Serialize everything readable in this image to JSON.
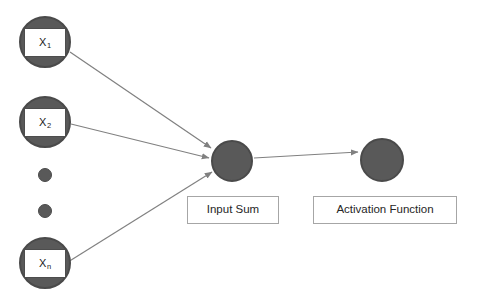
{
  "diagram": {
    "background_color": "#ffffff",
    "node_fill_color": "#595959",
    "node_border_color": "#4a4a4a",
    "arrow_color": "#808080",
    "caption_border_color": "#a6a6a6",
    "label_border_color": "#4d4d4d",
    "text_color": "#262626"
  },
  "inputs": [
    {
      "id": "x1",
      "label_base": "X",
      "label_sub": "1",
      "cx": 45,
      "cy": 42,
      "r": 26
    },
    {
      "id": "x2",
      "label_base": "X",
      "label_sub": "2",
      "cx": 45,
      "cy": 122,
      "r": 26
    },
    {
      "id": "xn",
      "label_base": "X",
      "label_sub": "n",
      "cx": 45,
      "cy": 263,
      "r": 26
    }
  ],
  "ellipsis": [
    {
      "id": "dot-1",
      "cx": 45,
      "cy": 175,
      "r": 7
    },
    {
      "id": "dot-2",
      "cx": 45,
      "cy": 211,
      "r": 7
    }
  ],
  "nodes": {
    "sum": {
      "id": "input-sum",
      "cx": 232,
      "cy": 161,
      "r": 21,
      "caption": "Input Sum",
      "caption_x": 187,
      "caption_y": 196,
      "caption_w": 92,
      "caption_h": 28
    },
    "activation": {
      "id": "activation-function",
      "cx": 382,
      "cy": 160,
      "r": 22,
      "caption": "Activation Function",
      "caption_x": 313,
      "caption_y": 196,
      "caption_w": 144,
      "caption_h": 28
    }
  },
  "edges": [
    {
      "id": "edge-x1-sum",
      "from": "x1",
      "to": "input-sum",
      "x1": 70,
      "y1": 52,
      "x2": 211,
      "y2": 148
    },
    {
      "id": "edge-x2-sum",
      "from": "x2",
      "to": "input-sum",
      "x1": 71,
      "y1": 124,
      "x2": 209,
      "y2": 158
    },
    {
      "id": "edge-xn-sum",
      "from": "xn",
      "to": "input-sum",
      "x1": 68,
      "y1": 262,
      "x2": 212,
      "y2": 172
    },
    {
      "id": "edge-sum-activation",
      "from": "input-sum",
      "to": "activation-function",
      "x1": 254,
      "y1": 158,
      "x2": 358,
      "y2": 152
    }
  ]
}
